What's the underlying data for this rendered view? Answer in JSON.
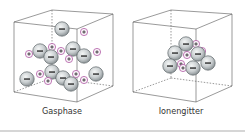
{
  "panels": [
    {
      "label": "Gasphase",
      "state": "ions dispersed"
    },
    {
      "label": "Ionengitter",
      "state": "ions packed in lattice"
    }
  ],
  "symbols": {
    "anion": "−",
    "cation": "+"
  },
  "colors": {
    "anion_fill": "#c9ced0",
    "anion_stroke": "#6e7679",
    "cation_fill": "#f4e9f3",
    "cation_stroke": "#b05aa4",
    "box_stroke": "#555555"
  }
}
